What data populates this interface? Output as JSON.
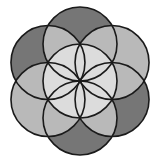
{
  "diagram": {
    "center": [
      80,
      81
    ],
    "radius": 37,
    "stroke_color": "#1a1a1a",
    "stroke_width": 1.6,
    "colors": {
      "dark": "#767676",
      "light": "#b9b9b9",
      "medium": "#a3a3a3",
      "petal": "#dcdcdc",
      "background": "#ffffff"
    },
    "outer_circles": [
      {
        "name": "top",
        "angle": -90,
        "shade": "dark"
      },
      {
        "name": "upper-right",
        "angle": -30,
        "shade": "light"
      },
      {
        "name": "lower-right",
        "angle": 30,
        "shade": "dark"
      },
      {
        "name": "bottom",
        "angle": 90,
        "shade": "dark"
      },
      {
        "name": "lower-left",
        "angle": 150,
        "shade": "light"
      },
      {
        "name": "upper-left",
        "angle": 210,
        "shade": "dark"
      }
    ]
  }
}
